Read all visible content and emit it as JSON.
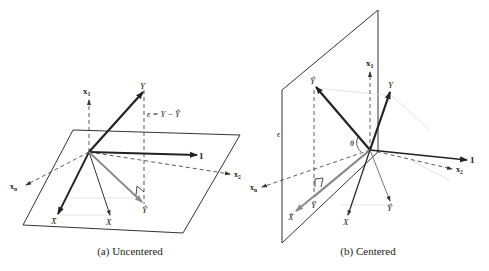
{
  "panels": [
    {
      "caption": "(a) Uncentered",
      "labels": {
        "x1": "x",
        "x1_sub": "1",
        "x2": "x",
        "x2_sub": "2",
        "xn": "x",
        "xn_sub": "n",
        "one": "1",
        "Y": "Y",
        "Yhat": "Ŷ",
        "X": "X",
        "Xbar": "X̄",
        "epsilon": "ϵ = Y − Ŷ"
      }
    },
    {
      "caption": "(b) Centered",
      "labels": {
        "x1": "x",
        "x1_sub": "1",
        "x2": "x",
        "x2_sub": "2",
        "xn": "x",
        "xn_sub": "n",
        "one": "1",
        "Y": "Y",
        "Yhat": "Ŷ",
        "Yhat_dup": "Ŷ",
        "Ybar": "Ȳ",
        "X": "X",
        "Xbar": "X̃",
        "epsilon": "ϵ",
        "theta": "θ"
      }
    }
  ],
  "colors": {
    "ink": "#222222",
    "gray_vector": "#8a8a8a",
    "faint": "#d8d8d8"
  }
}
